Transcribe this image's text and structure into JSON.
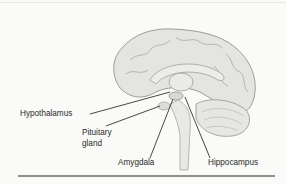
{
  "figure": {
    "labels": {
      "hypothalamus": "Hypothalamus",
      "pituitary_line1": "Pituitary",
      "pituitary_line2": "gland",
      "amygdala": "Amygdala",
      "hippocampus": "Hippocampus"
    },
    "colors": {
      "background": "#fafaf8",
      "brain_fill": "#e2e2e0",
      "brain_stroke": "#9a9a98",
      "leader_line": "#333333",
      "bottom_rule": "#8f8f8f"
    }
  }
}
